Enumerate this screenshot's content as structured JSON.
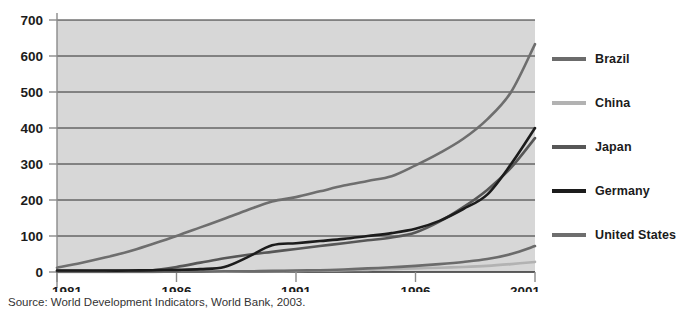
{
  "chart_data": {
    "type": "line",
    "title": "",
    "subtitle": "",
    "xlabel": "",
    "ylabel": "",
    "xlim": [
      1981,
      2001
    ],
    "ylim": [
      0,
      700
    ],
    "grid": true,
    "legend_position": "right",
    "y_ticks": [
      0,
      100,
      200,
      300,
      400,
      500,
      600,
      700
    ],
    "x_ticks": [
      1981,
      1986,
      1991,
      1996,
      2001
    ],
    "x_tick_labels": [
      "1981",
      "1986",
      "1991",
      "1996",
      "2001"
    ],
    "y_tick_labels": [
      "0",
      "100",
      "200",
      "300",
      "400",
      "500",
      "600",
      "700"
    ],
    "x": [
      1981,
      1982,
      1983,
      1984,
      1985,
      1986,
      1987,
      1988,
      1989,
      1990,
      1991,
      1992,
      1993,
      1994,
      1995,
      1996,
      1997,
      1998,
      1999,
      2000,
      2001
    ],
    "series": [
      {
        "name": "United States",
        "color": "#6e6e6e",
        "values": [
          12,
          25,
          40,
          57,
          78,
          100,
          124,
          148,
          173,
          196,
          208,
          224,
          240,
          253,
          266,
          296,
          330,
          370,
          424,
          500,
          633
        ]
      },
      {
        "name": "Germany",
        "color": "#1c1c1c",
        "values": [
          4,
          4,
          4,
          4,
          5,
          6,
          8,
          14,
          42,
          74,
          80,
          86,
          92,
          100,
          108,
          120,
          142,
          175,
          215,
          300,
          400
        ]
      },
      {
        "name": "Japan",
        "color": "#575757",
        "values": [
          3,
          3,
          3,
          4,
          5,
          14,
          26,
          38,
          48,
          56,
          64,
          72,
          80,
          88,
          96,
          110,
          140,
          180,
          228,
          290,
          372
        ]
      },
      {
        "name": "Brazil",
        "color": "#6b6b6b",
        "values": [
          1,
          1,
          1,
          1,
          1,
          1,
          1,
          2,
          2,
          3,
          4,
          5,
          7,
          10,
          13,
          17,
          22,
          28,
          36,
          50,
          72
        ]
      },
      {
        "name": "China",
        "color": "#b2b2b2",
        "values": [
          0,
          0,
          0,
          0,
          0,
          1,
          1,
          1,
          2,
          2,
          3,
          4,
          5,
          6,
          8,
          10,
          12,
          14,
          17,
          22,
          28
        ]
      }
    ]
  },
  "legend": {
    "entries": [
      {
        "label": "Brazil",
        "color": "#6b6b6b"
      },
      {
        "label": "China",
        "color": "#b2b2b2"
      },
      {
        "label": "Japan",
        "color": "#575757"
      },
      {
        "label": "Germany",
        "color": "#1c1c1c"
      },
      {
        "label": "United States",
        "color": "#6e6e6e"
      }
    ]
  },
  "source": {
    "text": "Source: World Development Indicators, World Bank, 2003."
  },
  "style": {
    "plot_background": "#d7d7d7",
    "gridline_color": "#2d2d2d",
    "axis_color": "#8a8a8a",
    "text_color": "#1b1b1b"
  }
}
